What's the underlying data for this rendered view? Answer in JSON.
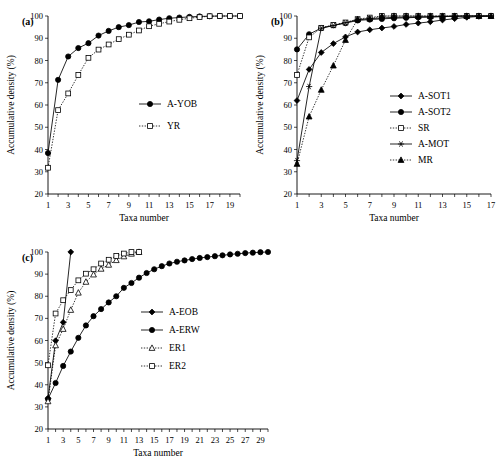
{
  "figure": {
    "type": "multi-panel-line-chart",
    "panels": [
      "a",
      "b",
      "c"
    ],
    "shared": {
      "ylabel": "Accumulative density (%)",
      "xlabel": "Taxa number",
      "ylim": [
        20,
        100
      ],
      "yticks": [
        20,
        30,
        40,
        50,
        60,
        70,
        80,
        90,
        100
      ],
      "ytick_labels": [
        "20",
        "30",
        "40",
        "50",
        "60",
        "70",
        "80",
        "90",
        "100"
      ],
      "grid": false,
      "legend_position": "inside-right"
    }
  },
  "chart_data": [
    {
      "type": "line",
      "panel_label": "(a)",
      "title": "",
      "xlabel": "Taxa number",
      "ylabel": "Accumulative density (%)",
      "ylim": [
        20,
        100
      ],
      "xlim": [
        1,
        20
      ],
      "yticks": [
        20,
        30,
        40,
        50,
        60,
        70,
        80,
        90,
        100
      ],
      "xticks": [
        1,
        3,
        5,
        7,
        9,
        11,
        13,
        15,
        17,
        19
      ],
      "xtick_labels": [
        "1",
        "3",
        "5",
        "7",
        "9",
        "11",
        "13",
        "15",
        "17",
        "19"
      ],
      "x": [
        1,
        2,
        3,
        4,
        5,
        6,
        7,
        8,
        9,
        10,
        11,
        12,
        13,
        14,
        15,
        16,
        17,
        18,
        19,
        20
      ],
      "series": [
        {
          "name": "A-YOB",
          "marker": "filled-circle",
          "linestyle": "solid",
          "values": [
            38.4,
            71.3,
            81.8,
            85.6,
            87.8,
            91.2,
            93.3,
            95.0,
            95.9,
            97.3,
            97.6,
            98.4,
            99.0,
            99.3,
            99.6,
            99.8,
            99.9,
            100.0,
            100.0,
            100.0
          ]
        },
        {
          "name": "YR",
          "marker": "open-square",
          "linestyle": "dotted",
          "values": [
            31.8,
            57.7,
            65.2,
            73.5,
            81.2,
            84.9,
            87.2,
            89.6,
            91.6,
            93.5,
            95.4,
            96.5,
            97.5,
            98.3,
            99.0,
            99.5,
            99.9,
            100.0,
            100.0,
            100.0
          ]
        }
      ]
    },
    {
      "type": "line",
      "panel_label": "(b)",
      "title": "",
      "xlabel": "Taxa number",
      "ylabel": "Accumulative density (%)",
      "ylim": [
        20,
        100
      ],
      "xlim": [
        1,
        17
      ],
      "yticks": [
        20,
        30,
        40,
        50,
        60,
        70,
        80,
        90,
        100
      ],
      "xticks": [
        1,
        3,
        5,
        7,
        9,
        11,
        13,
        15,
        17
      ],
      "xtick_labels": [
        "1",
        "3",
        "5",
        "7",
        "9",
        "11",
        "13",
        "15",
        "17"
      ],
      "x": [
        1,
        2,
        3,
        4,
        5,
        6,
        7,
        8,
        9,
        10,
        11,
        12,
        13,
        14,
        15,
        16,
        17
      ],
      "series": [
        {
          "name": "A-SOT1",
          "marker": "filled-diamond",
          "linestyle": "solid",
          "values": [
            62.0,
            76.0,
            83.6,
            87.6,
            90.6,
            92.8,
            93.8,
            94.6,
            95.3,
            96.2,
            96.8,
            97.4,
            98.2,
            98.8,
            99.4,
            99.8,
            100.0
          ]
        },
        {
          "name": "A-SOT2",
          "marker": "filled-circle",
          "linestyle": "solid",
          "values": [
            85.0,
            91.8,
            94.6,
            95.8,
            96.8,
            98.0,
            98.4,
            98.7,
            99.0,
            99.2,
            99.4,
            99.5,
            99.7,
            99.9,
            100.0,
            100.0,
            100.0
          ]
        },
        {
          "name": "SR",
          "marker": "open-square",
          "linestyle": "dotted",
          "values": [
            73.5,
            90.4,
            94.7,
            96.0,
            97.1,
            98.6,
            99.3,
            100.0,
            100.0,
            100.0,
            100.0,
            100.0,
            100.0,
            100.0,
            100.0,
            100.0,
            100.0
          ]
        },
        {
          "name": "A-MOT",
          "marker": "asterisk",
          "linestyle": "solid",
          "values": [
            35.0,
            68.3,
            94.5,
            95.7,
            97.0,
            98.3,
            98.8,
            99.1,
            99.4,
            99.5,
            99.6,
            99.7,
            99.8,
            99.9,
            100.0,
            100.0,
            100.0
          ]
        },
        {
          "name": "MR",
          "marker": "filled-triangle",
          "linestyle": "dotted",
          "values": [
            33.5,
            54.8,
            66.8,
            77.7,
            89.2,
            98.5,
            98.8,
            99.9,
            100.0,
            100.0,
            100.0,
            100.0,
            100.0,
            100.0,
            100.0,
            100.0,
            100.0
          ]
        }
      ]
    },
    {
      "type": "line",
      "panel_label": "(c)",
      "title": "",
      "xlabel": "Taxa number",
      "ylabel": "Accumulative density (%)",
      "ylim": [
        20,
        100
      ],
      "xlim": [
        1,
        30
      ],
      "yticks": [
        20,
        30,
        40,
        50,
        60,
        70,
        80,
        90,
        100
      ],
      "xticks": [
        1,
        3,
        5,
        7,
        9,
        11,
        13,
        15,
        17,
        19,
        21,
        23,
        25,
        27,
        29
      ],
      "xtick_labels": [
        "1",
        "3",
        "5",
        "7",
        "9",
        "11",
        "13",
        "15",
        "17",
        "19",
        "21",
        "23",
        "25",
        "27",
        "29"
      ],
      "x": [
        1,
        2,
        3,
        4,
        5,
        6,
        7,
        8,
        9,
        10,
        11,
        12,
        13,
        14,
        15,
        16,
        17,
        18,
        19,
        20,
        21,
        22,
        23,
        24,
        25,
        26,
        27,
        28,
        29,
        30
      ],
      "series": [
        {
          "name": "A-EOB",
          "marker": "filled-diamond",
          "linestyle": "solid",
          "values": [
            33.8,
            59.9,
            68.2,
            100.0,
            null,
            null,
            null,
            null,
            null,
            null,
            null,
            null,
            null,
            null,
            null,
            null,
            null,
            null,
            null,
            null,
            null,
            null,
            null,
            null,
            null,
            null,
            null,
            null,
            null,
            null
          ]
        },
        {
          "name": "A-ERW",
          "marker": "filled-circle",
          "linestyle": "solid",
          "values": [
            33.6,
            40.8,
            48.5,
            55.0,
            61.2,
            66.8,
            71.0,
            74.2,
            77.2,
            80.0,
            83.8,
            86.0,
            88.4,
            90.5,
            92.2,
            93.6,
            94.8,
            95.6,
            96.2,
            96.8,
            97.3,
            97.7,
            98.1,
            98.5,
            98.9,
            99.2,
            99.5,
            99.7,
            99.9,
            100.0
          ]
        },
        {
          "name": "ER1",
          "marker": "open-triangle",
          "linestyle": "dotted",
          "values": [
            32.5,
            57.8,
            65.2,
            73.8,
            81.6,
            86.5,
            89.8,
            92.4,
            94.2,
            96.3,
            98.0,
            99.2,
            100.0,
            null,
            null,
            null,
            null,
            null,
            null,
            null,
            null,
            null,
            null,
            null,
            null,
            null,
            null,
            null,
            null,
            null
          ]
        },
        {
          "name": "ER2",
          "marker": "open-square",
          "linestyle": "dotted",
          "values": [
            48.8,
            72.2,
            78.2,
            82.8,
            87.2,
            90.2,
            92.2,
            94.8,
            96.5,
            98.2,
            99.3,
            100.0,
            100.0,
            null,
            null,
            null,
            null,
            null,
            null,
            null,
            null,
            null,
            null,
            null,
            null,
            null,
            null,
            null,
            null,
            null
          ]
        }
      ]
    }
  ]
}
